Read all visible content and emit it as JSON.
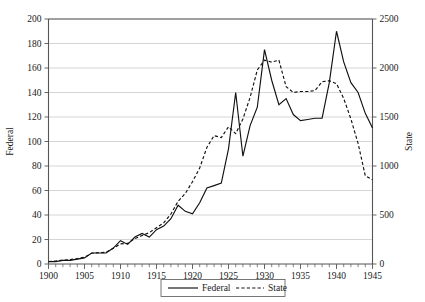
{
  "chart_data": {
    "type": "line",
    "title": "",
    "xlabel": "",
    "ylabel": "Federal",
    "y2label": "State",
    "xlim": [
      1900,
      1945
    ],
    "ylim": [
      0,
      200
    ],
    "y2lim": [
      0,
      2500
    ],
    "grid": true,
    "legend_position": "bottom-center",
    "x_ticks": [
      1900,
      1905,
      1910,
      1915,
      1920,
      1925,
      1930,
      1935,
      1940,
      1945
    ],
    "x_tick_labels": [
      "1900",
      "1905",
      "1910",
      "1915",
      "1920",
      "1925",
      "1930",
      "1935",
      "1940",
      "1945"
    ],
    "x_minor_tick_step": 1,
    "y_ticks": [
      0,
      20,
      40,
      60,
      80,
      100,
      120,
      140,
      160,
      180,
      200
    ],
    "y_tick_labels": [
      "0",
      "20",
      "40",
      "60",
      "80",
      "100",
      "120",
      "140",
      "160",
      "180",
      "200"
    ],
    "y2_ticks": [
      0,
      500,
      1000,
      1500,
      2000,
      2500
    ],
    "y2_tick_labels": [
      "0",
      "500",
      "1000",
      "1500",
      "2000",
      "2500"
    ],
    "x": [
      1900,
      1901,
      1902,
      1903,
      1904,
      1905,
      1906,
      1907,
      1908,
      1909,
      1910,
      1911,
      1912,
      1913,
      1914,
      1915,
      1916,
      1917,
      1918,
      1919,
      1920,
      1921,
      1922,
      1923,
      1924,
      1925,
      1926,
      1927,
      1928,
      1929,
      1930,
      1931,
      1932,
      1933,
      1934,
      1935,
      1936,
      1937,
      1938,
      1939,
      1940,
      1941,
      1942,
      1943,
      1944,
      1945
    ],
    "series": [
      {
        "name": "Federal",
        "axis": "left",
        "style": "solid",
        "color": "#111111",
        "values": [
          2,
          2,
          3,
          3,
          4,
          5,
          9,
          9,
          9,
          13,
          19,
          16,
          22,
          25,
          22,
          28,
          31,
          37,
          48,
          43,
          41,
          50,
          62,
          64,
          66,
          94,
          140,
          88,
          113,
          128,
          175,
          150,
          130,
          135,
          122,
          117,
          118,
          119,
          119,
          148,
          190,
          165,
          148,
          140,
          123,
          111
        ]
      },
      {
        "name": "State",
        "axis": "right",
        "style": "dashed",
        "color": "#111111",
        "values": [
          25,
          30,
          40,
          45,
          55,
          70,
          110,
          115,
          120,
          160,
          205,
          210,
          260,
          290,
          320,
          370,
          420,
          510,
          640,
          720,
          840,
          980,
          1190,
          1310,
          1290,
          1400,
          1330,
          1480,
          1700,
          1980,
          2080,
          2060,
          2080,
          1810,
          1750,
          1760,
          1760,
          1770,
          1860,
          1870,
          1840,
          1690,
          1480,
          1230,
          900,
          860
        ]
      }
    ],
    "legend": [
      {
        "label": "Federal",
        "style": "solid"
      },
      {
        "label": "State",
        "style": "dashed"
      }
    ]
  }
}
